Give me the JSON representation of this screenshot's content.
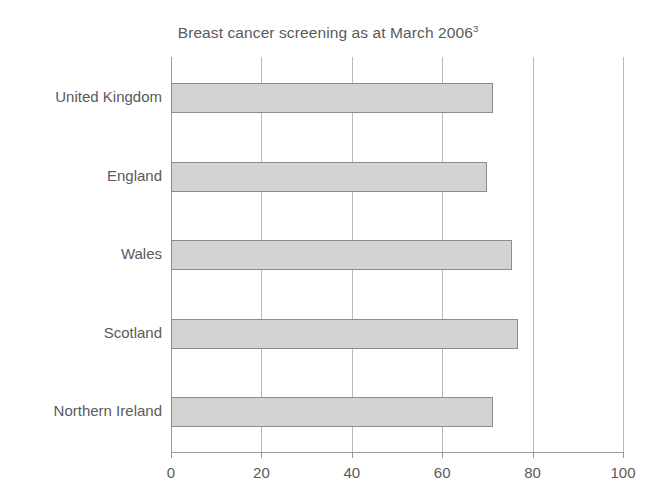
{
  "chart_data": {
    "type": "bar",
    "orientation": "horizontal",
    "title": "Breast cancer screening as at March 2006",
    "title_superscript": "3",
    "categories": [
      "United Kingdom",
      "England",
      "Wales",
      "Scotland",
      "Northern Ireland"
    ],
    "values": [
      71.2,
      70.0,
      75.4,
      76.8,
      71.2
    ],
    "xlabel": "",
    "ylabel": "",
    "xlim": [
      0,
      100
    ],
    "xticks": [
      0,
      20,
      40,
      60,
      80,
      100
    ],
    "xtick_labels": [
      "0",
      "20",
      "40",
      "60",
      "80",
      "100"
    ],
    "grid": "vertical",
    "legend": "none",
    "bar_fill_color": "#d3d3d3",
    "bar_border_color": "#8c8c8c",
    "gridline_color": "#b9b9b9",
    "axis_color": "#9a9a9a",
    "text_color": "#5a5a5a",
    "background_color": "#ffffff"
  }
}
